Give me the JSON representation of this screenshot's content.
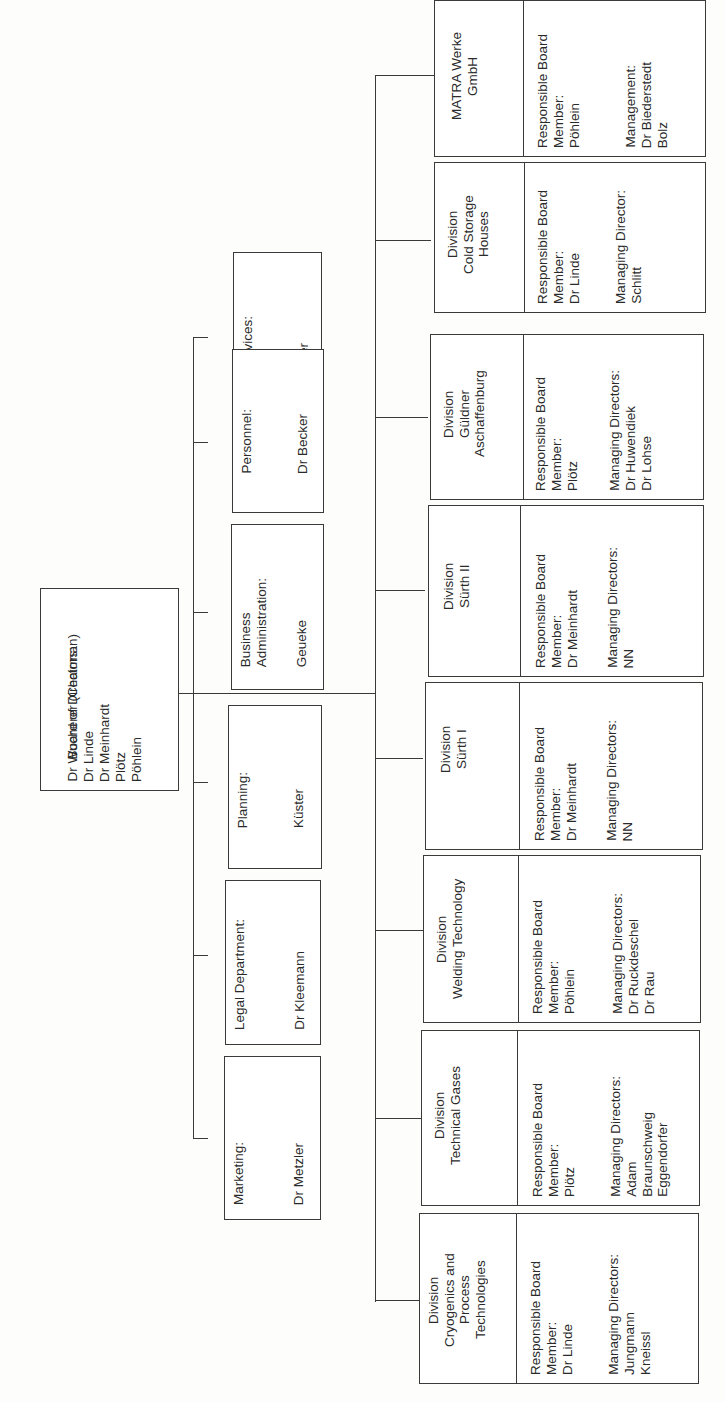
{
  "board": {
    "title": "Board of Directors:",
    "members": [
      "Dr Wucherer (Chairman)",
      "Dr Linde",
      "Dr Meinhardt",
      "Plötz",
      "Pöhlein"
    ]
  },
  "staff": [
    {
      "title": "Social Services:",
      "head": "Stadelhofer"
    },
    {
      "title": "Personnel:",
      "head": "Dr Becker"
    },
    {
      "title": "Business\nAdministration:",
      "head": "Geueke"
    },
    {
      "title": "Planning:",
      "head": "Küster"
    },
    {
      "title": "Legal Department:",
      "head": "Dr Kleemann"
    },
    {
      "title": "Marketing:",
      "head": "Dr Metzler"
    }
  ],
  "divisions": [
    {
      "name": "MATRA Werke\nGmbH",
      "board_label": "Responsible Board\nMember:",
      "board_member": "Pöhlein",
      "mgmt_label": "Management:",
      "mgmt": "Dr Biederstedt\nBolz"
    },
    {
      "name": "Division\nCold Storage\nHouses",
      "board_label": "Responsible Board\nMember:",
      "board_member": "Dr Linde",
      "mgmt_label": "Managing Director:",
      "mgmt": "Schlitt"
    },
    {
      "name": "Division\nGüldner\nAschaffenburg",
      "board_label": "Responsible Board\nMember:",
      "board_member": "Plötz",
      "mgmt_label": "Managing Directors:",
      "mgmt": "Dr Huwendiek\nDr Lohse"
    },
    {
      "name": "Division\nSürth II",
      "board_label": "Responsible Board\nMember:",
      "board_member": "Dr Meinhardt",
      "mgmt_label": "Managing Directors:",
      "mgmt": "NN"
    },
    {
      "name": "Division\nSürth I",
      "board_label": "Responsible Board\nMember:",
      "board_member": "Dr Meinhardt",
      "mgmt_label": "Managing Directors:",
      "mgmt": "NN"
    },
    {
      "name": "Division\nWelding Technology",
      "board_label": "Responsible Board\nMember:",
      "board_member": "Pöhlein",
      "mgmt_label": "Managing Directors:",
      "mgmt": "Dr Ruckdeschel\nDr Rau"
    },
    {
      "name": "Division\nTechnical Gases",
      "board_label": "Responsible Board\nMember:",
      "board_member": "Plötz",
      "mgmt_label": "Managing Directors:",
      "mgmt": "Adam\nBraunschweig\nEggendorfer"
    },
    {
      "name": "Division\nCryogenics and\nProcess\nTechnologies",
      "board_label": "Responsible Board\nMember:",
      "board_member": "Dr Linde",
      "mgmt_label": "Managing Directors:",
      "mgmt": "Jungmann\nKneissl"
    }
  ]
}
